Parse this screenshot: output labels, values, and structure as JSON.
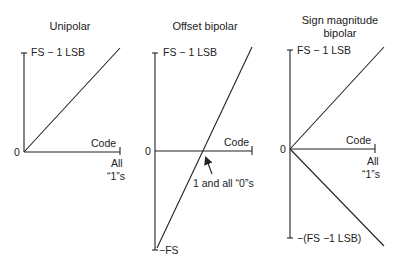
{
  "panels": [
    {
      "title": "Unipolar",
      "top_label": "FS − 1 LSB",
      "zero_label": "0",
      "axis_label": "Code",
      "end_label_1": "All",
      "end_label_2": "“1”s"
    },
    {
      "title": "Offset bipolar",
      "top_label": "FS − 1 LSB",
      "zero_label": "0",
      "axis_label": "Code",
      "annotation": "1 and all “0”s",
      "bottom_label": "−FS"
    },
    {
      "title_line1": "Sign magnitude",
      "title_line2": "bipolar",
      "top_label": "FS − 1 LSB",
      "zero_label": "0",
      "axis_label": "Code",
      "end_label_1": "All",
      "end_label_2": "“1”s",
      "bottom_label": "−(FS −1 LSB)"
    }
  ],
  "colors": {
    "line": "#222222",
    "background": "#ffffff"
  }
}
